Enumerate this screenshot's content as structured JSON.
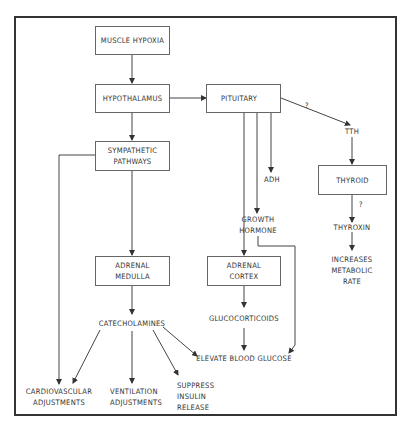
{
  "diagram": {
    "nodes": {
      "muscle_hypoxia": "MUSCLE HYPOXIA",
      "hypothalamus": "HYPOTHALAMUS",
      "pituitary": "PITUITARY",
      "sympathetic_line1": "SYMPATHETIC",
      "sympathetic_line2": "PATHWAYS",
      "adrenal_medulla_line1": "ADRENAL",
      "adrenal_medulla_line2": "MEDULLA",
      "catecholamines": "CATECHOLAMINES",
      "adh": "ADH",
      "growth_hormone_line1": "GROWTH",
      "growth_hormone_line2": "HORMONE",
      "adrenal_cortex_line1": "ADRENAL",
      "adrenal_cortex_line2": "CORTEX",
      "glucocorticoids": "GLUCOCORTICOIDS",
      "elevate_blood_glucose": "ELEVATE BLOOD GLUCOSE",
      "tth": "TTH",
      "thyroid": "THYROID",
      "thyroxin": "THYROXIN",
      "increases_line1": "INCREASES",
      "increases_line2": "METABOLIC",
      "increases_line3": "RATE",
      "cardio_line1": "CARDIOVASCULAR",
      "cardio_line2": "ADJUSTMENTS",
      "vent_line1": "VENTILATION",
      "vent_line2": "ADJUSTMENTS",
      "suppress_line1": "SUPPRESS",
      "suppress_line2": "INSULIN",
      "suppress_line3": "RELEASE"
    },
    "annotations": {
      "pituitary_to_tth": "?",
      "thyroid_to_thyroxin": "?"
    },
    "line_color": "#333333"
  }
}
